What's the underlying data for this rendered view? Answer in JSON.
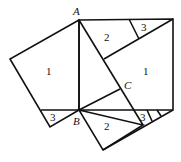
{
  "diagram": {
    "type": "geometric-proof",
    "vertices": {
      "A": "A",
      "B": "B",
      "C": "C"
    },
    "region_labels": {
      "left_square_1": "1",
      "left_square_3": "3",
      "right_top_2": "2",
      "right_top_3": "3",
      "right_big_1": "1",
      "bottom_2": "2",
      "bottom_3": "3"
    }
  }
}
